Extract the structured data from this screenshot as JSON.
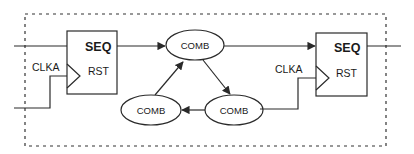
{
  "diagram": {
    "boundary": {
      "style": "dashed",
      "color": "#333333"
    },
    "blocks": [
      {
        "id": "seq-left",
        "title": "SEQ",
        "reset_label": "RST",
        "clock_label": "CLKA"
      },
      {
        "id": "seq-right",
        "title": "SEQ",
        "reset_label": "RST",
        "clock_label": "CLKA"
      }
    ],
    "comb_nodes": [
      {
        "id": "comb-top",
        "label": "COMB"
      },
      {
        "id": "comb-bottom-left",
        "label": "COMB"
      },
      {
        "id": "comb-bottom-right",
        "label": "COMB"
      }
    ],
    "edges": [
      {
        "from": "seq-left",
        "to": "comb-top"
      },
      {
        "from": "comb-top",
        "to": "seq-right"
      },
      {
        "from": "comb-top",
        "to": "comb-bottom-right"
      },
      {
        "from": "comb-bottom-right",
        "to": "comb-bottom-left"
      },
      {
        "from": "comb-bottom-left",
        "to": "comb-top"
      }
    ],
    "colors": {
      "stroke": "#2a2a2a",
      "text": "#1a1a1a",
      "background": "#ffffff"
    }
  }
}
